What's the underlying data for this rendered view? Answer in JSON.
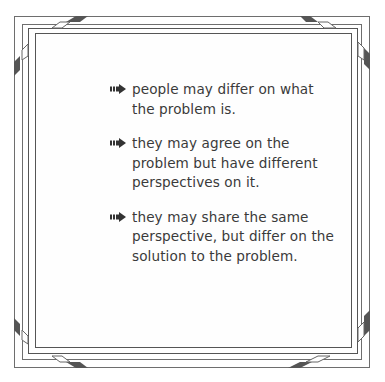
{
  "slide": {
    "bullets": [
      {
        "icon": "arrow-right-icon",
        "text": "people may differ on what the problem is."
      },
      {
        "icon": "arrow-right-icon",
        "text": "they may agree on the problem but have different perspectives on it."
      },
      {
        "icon": "arrow-right-icon",
        "text": "they may share the same perspective, but differ on the solution to the problem."
      }
    ]
  },
  "colors": {
    "frame_border": "#555555",
    "bevel_dark": "#555555",
    "text": "#3a3a3a",
    "background": "#ffffff"
  }
}
